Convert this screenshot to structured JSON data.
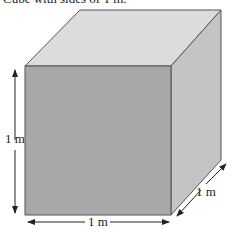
{
  "caption": "Cube with sides of 1 m.",
  "diagram": {
    "shape": "cube",
    "labels": {
      "height": "1 m",
      "width": "1 m",
      "depth": "1 m"
    },
    "colors": {
      "front": "#a8a8a8",
      "top": "#dcdcdc",
      "side": "#c4c4c4",
      "edge": "#555555"
    }
  }
}
